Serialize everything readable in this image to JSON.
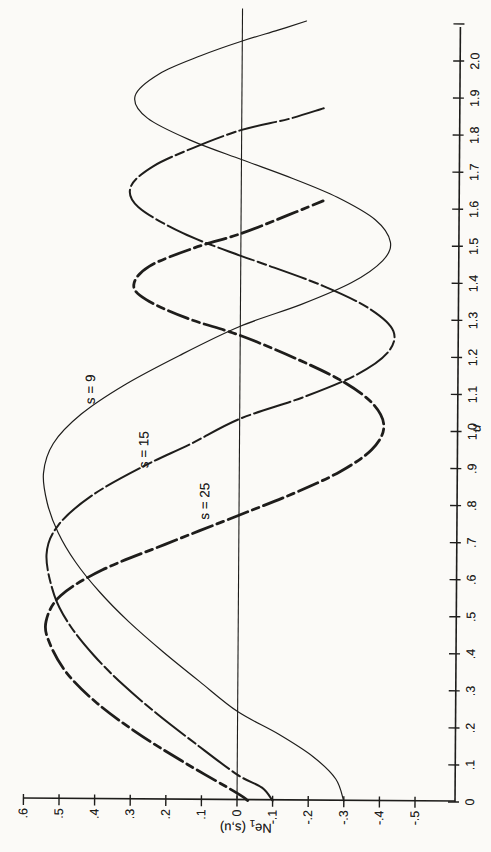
{
  "page": {
    "background": "#fbfaf7",
    "ink": "#1e1d1b"
  },
  "chart_data": {
    "type": "line",
    "title": "",
    "xlabel": "u",
    "ylabel": "Ne1 (s,u)",
    "ylabel_parts": {
      "prefix": "Ne",
      "sub": "1",
      "suffix": " (s,u)"
    },
    "xlim": [
      0,
      2.11
    ],
    "ylim": [
      -0.61,
      0.62
    ],
    "grid": false,
    "zero_line": true,
    "legend_position": "inline-curve-labels",
    "orientation": "figure rotated 90 degrees counter-clockwise on page",
    "x_ticks": [
      {
        "v": 0.0,
        "label": "0"
      },
      {
        "v": 0.1,
        "label": ".1"
      },
      {
        "v": 0.2,
        "label": ".2"
      },
      {
        "v": 0.3,
        "label": ".3"
      },
      {
        "v": 0.4,
        "label": ".4"
      },
      {
        "v": 0.5,
        "label": ".5"
      },
      {
        "v": 0.6,
        "label": ".6"
      },
      {
        "v": 0.7,
        "label": ".7"
      },
      {
        "v": 0.8,
        "label": ".8"
      },
      {
        "v": 0.9,
        "label": ".9"
      },
      {
        "v": 1.0,
        "label": "1.0"
      },
      {
        "v": 1.1,
        "label": "1.1"
      },
      {
        "v": 1.2,
        "label": "1.2"
      },
      {
        "v": 1.3,
        "label": "1.3"
      },
      {
        "v": 1.4,
        "label": "1.4"
      },
      {
        "v": 1.5,
        "label": "1.5"
      },
      {
        "v": 1.6,
        "label": "1.6"
      },
      {
        "v": 1.7,
        "label": "1.7"
      },
      {
        "v": 1.8,
        "label": "1.8"
      },
      {
        "v": 1.9,
        "label": "1.9"
      },
      {
        "v": 2.0,
        "label": "2.0"
      },
      {
        "v": 2.1,
        "label": ""
      }
    ],
    "y_ticks": [
      {
        "v": 0.6,
        "label": ".6"
      },
      {
        "v": 0.5,
        "label": ".5"
      },
      {
        "v": 0.4,
        "label": ".4"
      },
      {
        "v": 0.3,
        "label": ".3"
      },
      {
        "v": 0.2,
        "label": ".2"
      },
      {
        "v": 0.1,
        "label": ".1"
      },
      {
        "v": 0.0,
        "label": "0"
      },
      {
        "v": -0.1,
        "label": "-.1"
      },
      {
        "v": -0.2,
        "label": "-.2"
      },
      {
        "v": -0.3,
        "label": "-.3"
      },
      {
        "v": -0.4,
        "label": "-.4"
      },
      {
        "v": -0.5,
        "label": "-.5"
      }
    ],
    "series": [
      {
        "name": "s9",
        "label": "s = 9",
        "style": "thin-solid",
        "label_pos": {
          "u": 1.107,
          "ne": 0.407
        },
        "points": [
          [
            0.0,
            -0.3
          ],
          [
            0.06,
            -0.277
          ],
          [
            0.12,
            -0.212
          ],
          [
            0.18,
            -0.115
          ],
          [
            0.24,
            0.0
          ],
          [
            0.32,
            0.107
          ],
          [
            0.4,
            0.211
          ],
          [
            0.48,
            0.307
          ],
          [
            0.56,
            0.39
          ],
          [
            0.64,
            0.458
          ],
          [
            0.72,
            0.508
          ],
          [
            0.8,
            0.539
          ],
          [
            0.88,
            0.55
          ],
          [
            0.96,
            0.523
          ],
          [
            1.04,
            0.445
          ],
          [
            1.12,
            0.323
          ],
          [
            1.2,
            0.17
          ],
          [
            1.28,
            0.0
          ],
          [
            1.34,
            -0.171
          ],
          [
            1.4,
            -0.312
          ],
          [
            1.46,
            -0.399
          ],
          [
            1.51,
            -0.42
          ],
          [
            1.57,
            -0.377
          ],
          [
            1.63,
            -0.27
          ],
          [
            1.68,
            -0.144
          ],
          [
            1.73,
            0.0
          ],
          [
            1.78,
            0.141
          ],
          [
            1.84,
            0.265
          ],
          [
            1.9,
            0.3
          ],
          [
            1.96,
            0.232
          ],
          [
            2.01,
            0.115
          ],
          [
            2.05,
            0.0
          ],
          [
            2.08,
            -0.1
          ],
          [
            2.105,
            -0.18
          ]
        ]
      },
      {
        "name": "s15",
        "label": "s = 15",
        "style": "medium-dashdot",
        "label_pos": {
          "u": 0.945,
          "ne": 0.256
        },
        "points": [
          [
            0.0,
            -0.1
          ],
          [
            0.035,
            -0.07
          ],
          [
            0.07,
            0.0
          ],
          [
            0.15,
            0.114
          ],
          [
            0.23,
            0.223
          ],
          [
            0.31,
            0.322
          ],
          [
            0.39,
            0.406
          ],
          [
            0.47,
            0.473
          ],
          [
            0.55,
            0.517
          ],
          [
            0.66,
            0.54
          ],
          [
            0.74,
            0.507
          ],
          [
            0.82,
            0.414
          ],
          [
            0.9,
            0.27
          ],
          [
            0.96,
            0.14
          ],
          [
            1.03,
            0.0
          ],
          [
            1.09,
            -0.179
          ],
          [
            1.15,
            -0.325
          ],
          [
            1.21,
            -0.413
          ],
          [
            1.27,
            -0.43
          ],
          [
            1.33,
            -0.362
          ],
          [
            1.39,
            -0.233
          ],
          [
            1.45,
            -0.061
          ],
          [
            1.47,
            0.0
          ],
          [
            1.53,
            0.163
          ],
          [
            1.6,
            0.289
          ],
          [
            1.655,
            0.31
          ],
          [
            1.71,
            0.248
          ],
          [
            1.76,
            0.137
          ],
          [
            1.81,
            0.0
          ],
          [
            1.84,
            -0.13
          ],
          [
            1.87,
            -0.23
          ]
        ]
      },
      {
        "name": "s25",
        "label": "s = 25",
        "style": "heavy-dashdot",
        "label_pos": {
          "u": 0.807,
          "ne": 0.084
        },
        "points": [
          [
            0.0,
            -0.03
          ],
          [
            0.02,
            0.0
          ],
          [
            0.1,
            0.146
          ],
          [
            0.18,
            0.281
          ],
          [
            0.26,
            0.395
          ],
          [
            0.34,
            0.48
          ],
          [
            0.42,
            0.529
          ],
          [
            0.48,
            0.54
          ],
          [
            0.55,
            0.499
          ],
          [
            0.62,
            0.382
          ],
          [
            0.69,
            0.207
          ],
          [
            0.77,
            0.0
          ],
          [
            0.83,
            -0.153
          ],
          [
            0.89,
            -0.284
          ],
          [
            0.95,
            -0.372
          ],
          [
            1.01,
            -0.405
          ],
          [
            1.07,
            -0.377
          ],
          [
            1.13,
            -0.294
          ],
          [
            1.19,
            -0.166
          ],
          [
            1.255,
            0.0
          ],
          [
            1.3,
            0.148
          ],
          [
            1.35,
            0.265
          ],
          [
            1.39,
            0.3
          ],
          [
            1.44,
            0.257
          ],
          [
            1.49,
            0.133
          ],
          [
            1.53,
            0.0
          ],
          [
            1.58,
            -0.13
          ],
          [
            1.62,
            -0.23
          ]
        ]
      }
    ]
  }
}
